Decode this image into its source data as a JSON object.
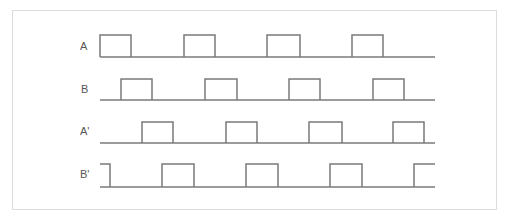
{
  "diagram": {
    "type": "timing-diagram",
    "line_color": "#7a7a7a",
    "frame_color": "#dcdcdc",
    "x_start": 100,
    "x_end": 435,
    "signals": [
      {
        "label": "A",
        "label_x": 80,
        "label_y": 40,
        "top": 35,
        "base": 57,
        "start_high": false,
        "pulses": [
          [
            100,
            131
          ],
          [
            184,
            215
          ],
          [
            267,
            300
          ],
          [
            352,
            383
          ]
        ]
      },
      {
        "label": "B",
        "label_x": 81,
        "label_y": 83,
        "top": 79,
        "base": 100,
        "start_high": false,
        "pulses": [
          [
            121,
            152
          ],
          [
            205,
            237
          ],
          [
            289,
            320
          ],
          [
            373,
            404
          ]
        ]
      },
      {
        "label": "A'",
        "label_x": 80,
        "label_y": 125,
        "top": 122,
        "base": 143,
        "start_high": false,
        "pulses": [
          [
            142,
            173
          ],
          [
            226,
            257
          ],
          [
            309,
            342
          ],
          [
            393,
            424
          ]
        ]
      },
      {
        "label": "B'",
        "label_x": 80,
        "label_y": 168,
        "top": 164,
        "base": 187,
        "start_high": true,
        "pulses": [
          [
            100,
            110
          ],
          [
            162,
            194
          ],
          [
            246,
            278
          ],
          [
            330,
            362
          ],
          [
            414,
            435
          ]
        ]
      }
    ]
  }
}
